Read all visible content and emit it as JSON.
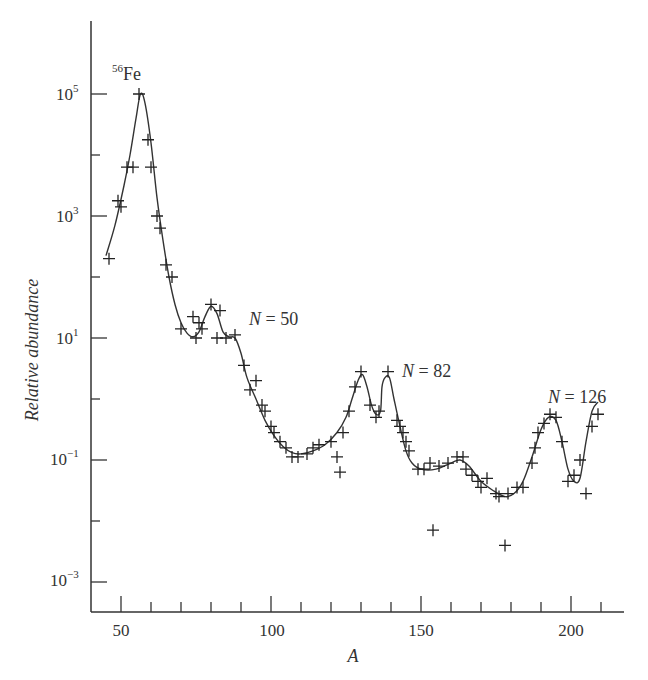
{
  "chart_data": {
    "type": "scatter",
    "title": "",
    "xlabel": "A",
    "ylabel": "Relative abundance",
    "yscale": "log",
    "xlim": [
      42,
      216
    ],
    "ylim_log10": [
      -3.5,
      6.2
    ],
    "xticks_major": [
      50,
      100,
      150,
      200
    ],
    "xticks_minor": [
      60,
      70,
      80,
      90,
      110,
      120,
      130,
      140,
      160,
      170,
      180,
      190,
      210
    ],
    "yticks_major": [
      {
        "log10": 5,
        "label_base": "10",
        "label_exp": "5"
      },
      {
        "log10": 3,
        "label_base": "10",
        "label_exp": "3"
      },
      {
        "log10": 1,
        "label_base": "10",
        "label_exp": "1"
      },
      {
        "log10": -1,
        "label_base": "10",
        "label_exp": "−1"
      },
      {
        "log10": -3,
        "label_base": "10",
        "label_exp": "−3"
      }
    ],
    "yticks_minor_log10": [
      4,
      2,
      0,
      -2
    ],
    "grid": false,
    "legend": null,
    "annotations": [
      {
        "text_sup": "56",
        "text": "Fe",
        "A": 57,
        "log10": 5.45
      },
      {
        "text_italic": "N",
        "text": " = 50",
        "A": 93,
        "log10": 1.3
      },
      {
        "text_italic": "N",
        "text": " = 82",
        "A": 143,
        "log10": 0.75
      },
      {
        "text_italic": "N",
        "text": " = 126",
        "A": 192,
        "log10": 0.0
      }
    ],
    "series": [
      {
        "name": "Measured abundances",
        "marker": "+",
        "points": [
          [
            46,
            2.3
          ],
          [
            49,
            3.25
          ],
          [
            50,
            3.15
          ],
          [
            52,
            3.8
          ],
          [
            54,
            3.8
          ],
          [
            56,
            5.0
          ],
          [
            59,
            4.25
          ],
          [
            60,
            3.8
          ],
          [
            62,
            3.0
          ],
          [
            63,
            2.8
          ],
          [
            65,
            2.2
          ],
          [
            67,
            2.0
          ],
          [
            70,
            1.15
          ],
          [
            74,
            1.35
          ],
          [
            75,
            1.0
          ],
          [
            76,
            1.25
          ],
          [
            77,
            1.15
          ],
          [
            80,
            1.55
          ],
          [
            82,
            1.0
          ],
          [
            83,
            1.45
          ],
          [
            85,
            1.0
          ],
          [
            88,
            1.05
          ],
          [
            91,
            0.55
          ],
          [
            93,
            0.15
          ],
          [
            95,
            0.3
          ],
          [
            97,
            -0.1
          ],
          [
            98,
            -0.2
          ],
          [
            100,
            -0.45
          ],
          [
            101,
            -0.55
          ],
          [
            103,
            -0.7
          ],
          [
            105,
            -0.8
          ],
          [
            107,
            -0.95
          ],
          [
            109,
            -0.95
          ],
          [
            112,
            -0.9
          ],
          [
            114,
            -0.8
          ],
          [
            116,
            -0.75
          ],
          [
            120,
            -0.7
          ],
          [
            122,
            -0.95
          ],
          [
            123,
            -1.2
          ],
          [
            124,
            -0.55
          ],
          [
            126,
            -0.2
          ],
          [
            128,
            0.2
          ],
          [
            130,
            0.45
          ],
          [
            133,
            -0.1
          ],
          [
            135,
            -0.3
          ],
          [
            136,
            -0.2
          ],
          [
            139,
            0.45
          ],
          [
            142,
            -0.35
          ],
          [
            143,
            -0.45
          ],
          [
            144,
            -0.55
          ],
          [
            145,
            -0.7
          ],
          [
            146,
            -0.85
          ],
          [
            149,
            -1.15
          ],
          [
            151,
            -1.15
          ],
          [
            153,
            -1.05
          ],
          [
            154,
            -2.15
          ],
          [
            156,
            -1.1
          ],
          [
            159,
            -1.05
          ],
          [
            162,
            -0.95
          ],
          [
            164,
            -0.95
          ],
          [
            165,
            -1.15
          ],
          [
            167,
            -1.25
          ],
          [
            169,
            -1.35
          ],
          [
            170,
            -1.45
          ],
          [
            172,
            -1.3
          ],
          [
            175,
            -1.55
          ],
          [
            176,
            -1.6
          ],
          [
            178,
            -2.4
          ],
          [
            179,
            -1.55
          ],
          [
            182,
            -1.45
          ],
          [
            184,
            -1.45
          ],
          [
            187,
            -1.05
          ],
          [
            188,
            -0.8
          ],
          [
            189,
            -0.55
          ],
          [
            191,
            -0.4
          ],
          [
            193,
            -0.25
          ],
          [
            195,
            -0.3
          ],
          [
            197,
            -0.7
          ],
          [
            199,
            -1.35
          ],
          [
            201,
            -1.25
          ],
          [
            203,
            -1.0
          ],
          [
            205,
            -1.55
          ],
          [
            207,
            -0.45
          ],
          [
            209,
            -0.25
          ]
        ]
      },
      {
        "name": "Smooth fit",
        "marker": "line",
        "points": [
          [
            45,
            2.35
          ],
          [
            48,
            2.85
          ],
          [
            51,
            3.5
          ],
          [
            53,
            4.0
          ],
          [
            55,
            4.6
          ],
          [
            56.5,
            5.0
          ],
          [
            58,
            4.85
          ],
          [
            60,
            4.2
          ],
          [
            62,
            3.3
          ],
          [
            64,
            2.6
          ],
          [
            66,
            2.0
          ],
          [
            68,
            1.55
          ],
          [
            70,
            1.25
          ],
          [
            72,
            1.08
          ],
          [
            74,
            1.02
          ],
          [
            76,
            1.1
          ],
          [
            78,
            1.35
          ],
          [
            80,
            1.52
          ],
          [
            82,
            1.4
          ],
          [
            84,
            1.1
          ],
          [
            86,
            1.02
          ],
          [
            88,
            1.0
          ],
          [
            90,
            0.75
          ],
          [
            92,
            0.35
          ],
          [
            95,
            0.0
          ],
          [
            98,
            -0.35
          ],
          [
            101,
            -0.6
          ],
          [
            104,
            -0.78
          ],
          [
            107,
            -0.88
          ],
          [
            110,
            -0.9
          ],
          [
            114,
            -0.85
          ],
          [
            118,
            -0.75
          ],
          [
            122,
            -0.55
          ],
          [
            125,
            -0.3
          ],
          [
            127,
            0.0
          ],
          [
            129,
            0.3
          ],
          [
            130.5,
            0.4
          ],
          [
            132,
            0.2
          ],
          [
            133.5,
            -0.1
          ],
          [
            135,
            -0.25
          ],
          [
            136.5,
            -0.2
          ],
          [
            137,
            0.2
          ],
          [
            138,
            0.35
          ],
          [
            139.5,
            0.35
          ],
          [
            141,
            0.0
          ],
          [
            143,
            -0.45
          ],
          [
            145,
            -0.85
          ],
          [
            147,
            -1.05
          ],
          [
            150,
            -1.15
          ],
          [
            155,
            -1.15
          ],
          [
            160,
            -1.05
          ],
          [
            163,
            -1.0
          ],
          [
            166,
            -1.1
          ],
          [
            170,
            -1.35
          ],
          [
            174,
            -1.5
          ],
          [
            178,
            -1.6
          ],
          [
            181,
            -1.55
          ],
          [
            184,
            -1.35
          ],
          [
            187,
            -0.95
          ],
          [
            190,
            -0.5
          ],
          [
            192.5,
            -0.3
          ],
          [
            195,
            -0.35
          ],
          [
            197,
            -0.7
          ],
          [
            199,
            -1.15
          ],
          [
            201,
            -1.35
          ],
          [
            203,
            -1.3
          ],
          [
            205,
            -0.7
          ],
          [
            207,
            -0.2
          ],
          [
            209,
            -0.05
          ]
        ]
      }
    ]
  },
  "labels": {
    "ylabel": "Relative abundance",
    "xlabel": "A",
    "x50": "50",
    "x100": "100",
    "x150": "150",
    "x200": "200",
    "y_base": "10",
    "y5": "5",
    "y3": "3",
    "y1": "1",
    "ym1": "−1",
    "ym3": "−3",
    "fe_sup": "56",
    "fe": "Fe",
    "n_italic": "N",
    "n50": " = 50",
    "n82": " = 82",
    "n126": " = 126"
  }
}
